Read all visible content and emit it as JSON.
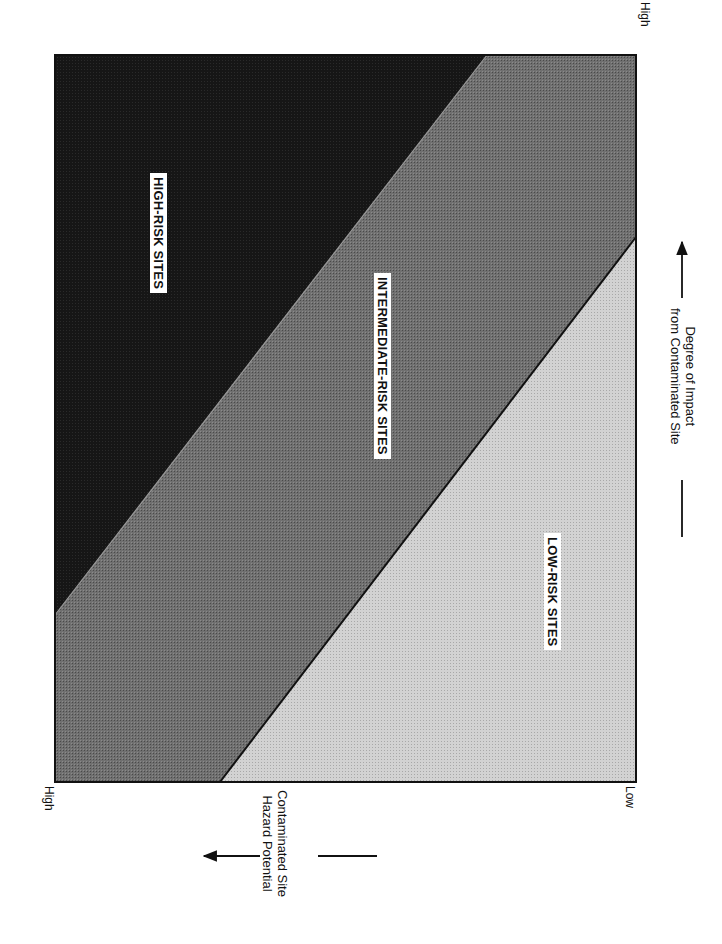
{
  "colors": {
    "high_risk_fill": "#111111",
    "intermediate_risk_fill": "#6e6e6e",
    "low_risk_fill": "#cfcfcf",
    "frame": "#111111",
    "background": "#ffffff"
  },
  "regions": {
    "high": {
      "label": "HIGH-RISK SITES"
    },
    "intermediate": {
      "label": "INTERMEDIATE-RISK SITES"
    },
    "low": {
      "label": "LOW-RISK SITES"
    }
  },
  "axes": {
    "hazard": {
      "title_line1": "Contaminated Site",
      "title_line2": "Hazard Potential",
      "tick_high": "High",
      "tick_low": "Low"
    },
    "impact": {
      "title_line1": "Degree of Impact",
      "title_line2": "from Contaminated Site",
      "tick_high": "High"
    }
  }
}
